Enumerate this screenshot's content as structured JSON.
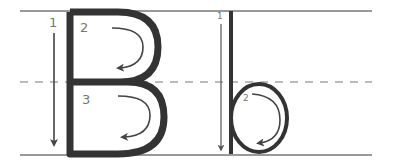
{
  "worksheet": {
    "letters": [
      {
        "letter": "B",
        "case": "uppercase",
        "strokes": [
          {
            "number": "1",
            "direction": "down"
          },
          {
            "number": "2",
            "direction": "curve-clockwise-upper-bowl"
          },
          {
            "number": "3",
            "direction": "curve-clockwise-lower-bowl"
          }
        ]
      },
      {
        "letter": "b",
        "case": "lowercase",
        "strokes": [
          {
            "number": "1",
            "direction": "down"
          },
          {
            "number": "2",
            "direction": "circle-clockwise"
          }
        ]
      }
    ],
    "guide_lines": [
      "top-line",
      "dashed-midline",
      "baseline"
    ],
    "colors": {
      "letter": "#333333",
      "guide": "#999999",
      "arrow": "#444444",
      "numbers": "#777777"
    }
  }
}
